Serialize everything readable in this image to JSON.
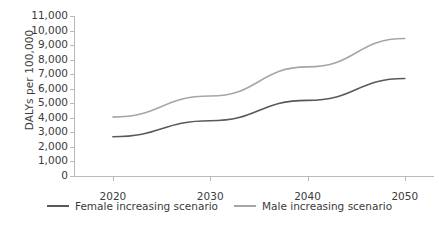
{
  "chart_data": {
    "type": "line",
    "title": "",
    "xlabel": "",
    "ylabel": "DALYs per 100,000",
    "x": [
      2020,
      2030,
      2040,
      2050
    ],
    "xticklabels": [
      "2020",
      "2030",
      "2040",
      "2050"
    ],
    "xlim": [
      2016,
      2053
    ],
    "ylim": [
      0,
      11000
    ],
    "yticks": [
      0,
      1000,
      2000,
      3000,
      4000,
      5000,
      6000,
      7000,
      8000,
      9000,
      10000,
      11000
    ],
    "yticklabels": [
      "0",
      "1,000",
      "2,000",
      "3,000",
      "4,000",
      "5,000",
      "6,000",
      "7,000",
      "8,000",
      "9,000",
      "10,000",
      "11,000"
    ],
    "grid": false,
    "legend_position": "bottom",
    "series": [
      {
        "name": "Female increasing scenario",
        "color": "#595959",
        "values": [
          2700,
          3800,
          5200,
          6700
        ]
      },
      {
        "name": "Male increasing scenario",
        "color": "#a6a6a6",
        "values": [
          4050,
          5500,
          7500,
          9450
        ]
      }
    ]
  },
  "axis": {
    "y_title": "DALYs per 100,000"
  },
  "legend": {
    "items": [
      {
        "label": "Female increasing scenario",
        "color": "#595959"
      },
      {
        "label": "Male increasing scenario",
        "color": "#a6a6a6"
      }
    ]
  },
  "colors": {
    "axis": "#b9b9b9",
    "text": "#3b3b3b",
    "background": "#ffffff",
    "female_line": "#595959",
    "male_line": "#a6a6a6"
  }
}
